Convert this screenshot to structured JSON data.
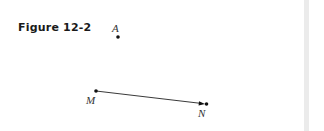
{
  "figure": {
    "title": "Figure 12-2"
  },
  "diagram": {
    "points": [
      {
        "id": "A",
        "label": "A",
        "x": 118,
        "y": 37,
        "label_x": 112,
        "label_y": 32
      },
      {
        "id": "M",
        "label": "M",
        "x": 96,
        "y": 91,
        "label_x": 86,
        "label_y": 104
      },
      {
        "id": "N",
        "label": "N",
        "x": 206,
        "y": 104,
        "label_x": 198,
        "label_y": 117
      }
    ],
    "segments": [
      {
        "from": "M",
        "to": "N",
        "arrow_at": "N"
      }
    ],
    "colors": {
      "stroke": "#222222",
      "point": "#111111"
    }
  },
  "scrollbar": {
    "color": "#ebebeb"
  }
}
